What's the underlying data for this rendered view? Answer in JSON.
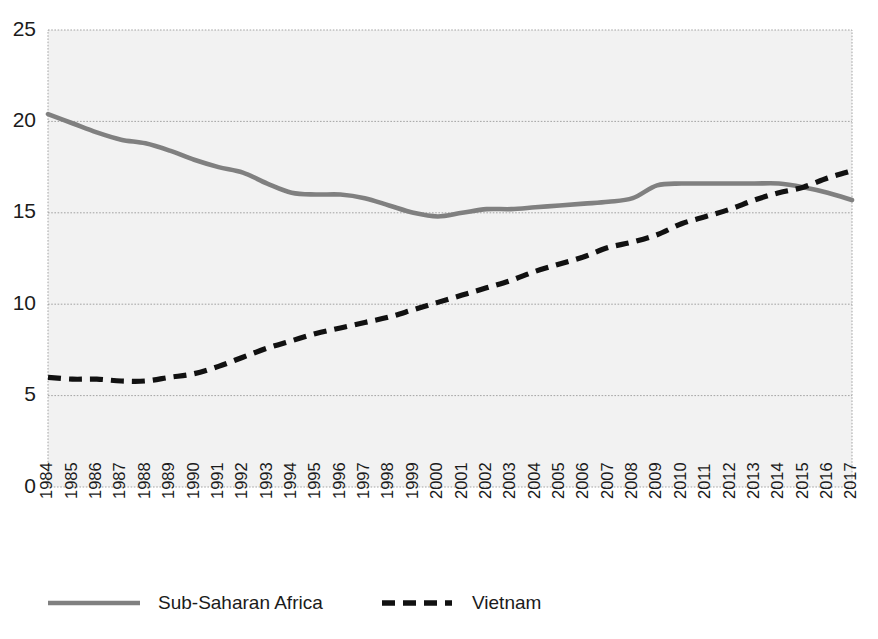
{
  "chart_data": {
    "type": "line",
    "title": "",
    "subtitle": "",
    "xlabel": "",
    "ylabel": "",
    "grid": true,
    "legend_position": "bottom",
    "ylim": [
      0,
      25
    ],
    "yticks": [
      0,
      5,
      10,
      15,
      20,
      25
    ],
    "x": [
      "1984",
      "1985",
      "1986",
      "1987",
      "1988",
      "1989",
      "1990",
      "1991",
      "1992",
      "1993",
      "1994",
      "1995",
      "1996",
      "1997",
      "1998",
      "1999",
      "2000",
      "2001",
      "2002",
      "2003",
      "2004",
      "2005",
      "2006",
      "2007",
      "2008",
      "2009",
      "2010",
      "2011",
      "2012",
      "2013",
      "2014",
      "2015",
      "2016",
      "2017"
    ],
    "series": [
      {
        "name": "Sub-Saharan Africa",
        "style": "solid",
        "color": "#808080",
        "values": [
          20.4,
          19.9,
          19.4,
          19.0,
          18.8,
          18.4,
          17.9,
          17.5,
          17.2,
          16.6,
          16.1,
          16.0,
          16.0,
          15.8,
          15.4,
          15.0,
          14.8,
          15.0,
          15.2,
          15.2,
          15.3,
          15.4,
          15.5,
          15.6,
          15.8,
          16.5,
          16.6,
          16.6,
          16.6,
          16.6,
          16.6,
          16.4,
          16.1,
          15.7
        ]
      },
      {
        "name": "Vietnam",
        "style": "dashed",
        "color": "#111111",
        "values": [
          6.0,
          5.9,
          5.9,
          5.8,
          5.8,
          6.0,
          6.2,
          6.6,
          7.1,
          7.6,
          8.0,
          8.4,
          8.7,
          9.0,
          9.3,
          9.7,
          10.1,
          10.5,
          10.9,
          11.3,
          11.8,
          12.2,
          12.6,
          13.1,
          13.4,
          13.8,
          14.4,
          14.8,
          15.2,
          15.7,
          16.1,
          16.4,
          16.9,
          17.3
        ]
      }
    ],
    "legend": [
      {
        "label": "Sub-Saharan Africa",
        "style": "solid",
        "color": "#808080"
      },
      {
        "label": "Vietnam",
        "style": "dashed",
        "color": "#111111"
      }
    ]
  },
  "colors": {
    "plot_background": "#f2f2f2",
    "gridline": "#9a9a9a",
    "text": "#1b1b1b",
    "series_ssa": "#808080",
    "series_vietnam": "#111111"
  }
}
